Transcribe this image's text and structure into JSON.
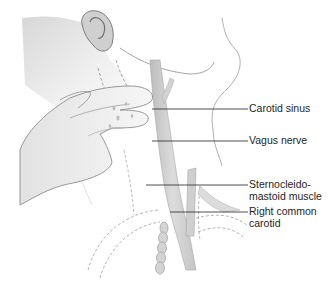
{
  "diagram": {
    "colors": {
      "skin_shade": "#d6d6d6",
      "outline": "#8a8a8a",
      "vessel": "#c9c9c9",
      "leader_line": "#3a3a3a",
      "label_text": "#1e1e1e",
      "background": "#ffffff"
    },
    "labels": [
      {
        "id": "carotid-sinus",
        "text": "Carotid sinus"
      },
      {
        "id": "vagus-nerve",
        "text": "Vagus nerve"
      },
      {
        "id": "sternocleidomastoid",
        "line1": "Sternocleido-",
        "line2": "mastoid muscle"
      },
      {
        "id": "right-common-carotid",
        "line1": "Right common",
        "line2": "carotid"
      }
    ]
  }
}
